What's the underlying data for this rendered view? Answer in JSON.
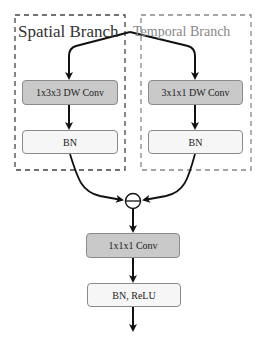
{
  "diagram": {
    "spatial_branch": {
      "title": "Spatial Branch",
      "conv_label": "1x3x3 DW Conv",
      "bn_label": "BN"
    },
    "temporal_branch": {
      "title": "Temporal Branch",
      "conv_label": "3x1x1 DW Conv",
      "bn_label": "BN"
    },
    "merge_operator": "⊖",
    "pointwise_conv_label": "1x1x1 Conv",
    "output_norm_label": "BN, ReLU"
  },
  "colors": {
    "conv_fill": "#c9c9c9",
    "norm_fill": "#f6f6f6",
    "border": "#8a8a8a",
    "arrow": "#111111",
    "dashed_frame": "#555555",
    "spatial_title": "#333333",
    "temporal_title": "#888888"
  }
}
